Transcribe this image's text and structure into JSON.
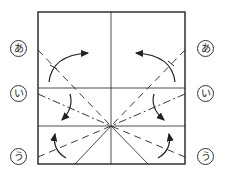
{
  "diagram": {
    "type": "origami-fold-diagram",
    "labels": {
      "a": "あ",
      "i": "い",
      "u": "う"
    },
    "colors": {
      "line": "#222222",
      "background": "#ffffff"
    }
  }
}
